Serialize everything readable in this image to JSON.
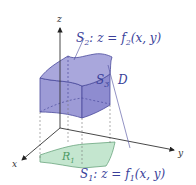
{
  "axes": {
    "x_label": "x",
    "y_label": "y",
    "z_label": "z"
  },
  "labels": {
    "s2_name": "S",
    "s2_sub": "2",
    "s2_eq_prefix": ": z = f",
    "s2_eq_sub": "2",
    "s2_eq_args": "(x, y)",
    "s1_name": "S",
    "s1_sub": "1",
    "s1_eq_prefix": ": z = f",
    "s1_eq_sub": "1",
    "s1_eq_args": "(x, y)",
    "s3_name": "S",
    "s3_sub": "3",
    "region_d": "D",
    "r1_name": "R",
    "r1_sub": "1"
  },
  "colors": {
    "solid_fill": "#9d9bd6",
    "solid_stroke": "#4a4a9c",
    "region_fill": "#c4e6cf",
    "region_stroke": "#6aa57e",
    "label_blue": "#3a3f9a",
    "label_green": "#4d9a63",
    "axis": "#333333"
  }
}
